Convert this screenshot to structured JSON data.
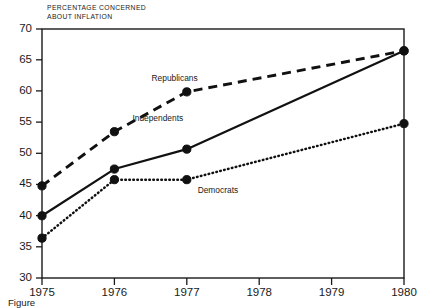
{
  "chart_data": {
    "type": "line",
    "title": "PERCENTAGE CONCERNED ABOUT INFLATION",
    "title_line1": "PERCENTAGE CONCERNED",
    "title_line2": "ABOUT INFLATION",
    "xlabel": "",
    "ylabel": "",
    "xlim": [
      1975,
      1980
    ],
    "ylim": [
      30,
      70
    ],
    "grid": false,
    "legend_position": "inline-annotations",
    "x": [
      1975,
      1976,
      1977,
      1980
    ],
    "categories": [
      "1975",
      "1976",
      "1977",
      "1978",
      "1979",
      "1980"
    ],
    "xticks": [
      "1975",
      "1976",
      "1977",
      "1978",
      "1979",
      "1980"
    ],
    "yticks": [
      "30",
      "35",
      "40",
      "45",
      "50",
      "55",
      "60",
      "65",
      "70"
    ],
    "series": [
      {
        "name": "Republicans",
        "style": "dashed",
        "x": [
          1975,
          1976,
          1977,
          1980
        ],
        "values": [
          44.8,
          53.5,
          59.9,
          66.5
        ],
        "label": "Republicans"
      },
      {
        "name": "Independents",
        "style": "solid",
        "x": [
          1975,
          1976,
          1977,
          1980
        ],
        "values": [
          40.0,
          47.5,
          50.7,
          66.5
        ],
        "label": "Independents"
      },
      {
        "name": "Democrats",
        "style": "dotted",
        "x": [
          1975,
          1976,
          1977,
          1980
        ],
        "values": [
          36.4,
          45.8,
          45.8,
          54.8
        ],
        "label": "Democrats"
      }
    ],
    "annotations": [
      {
        "text": "Republicans",
        "x": 1977.15,
        "y": 61.6
      },
      {
        "text": "Independents",
        "x": 1976.95,
        "y": 55.3
      },
      {
        "text": "Democrats",
        "x": 1977.15,
        "y": 43.6
      }
    ]
  },
  "caption": {
    "text": "Figure"
  }
}
